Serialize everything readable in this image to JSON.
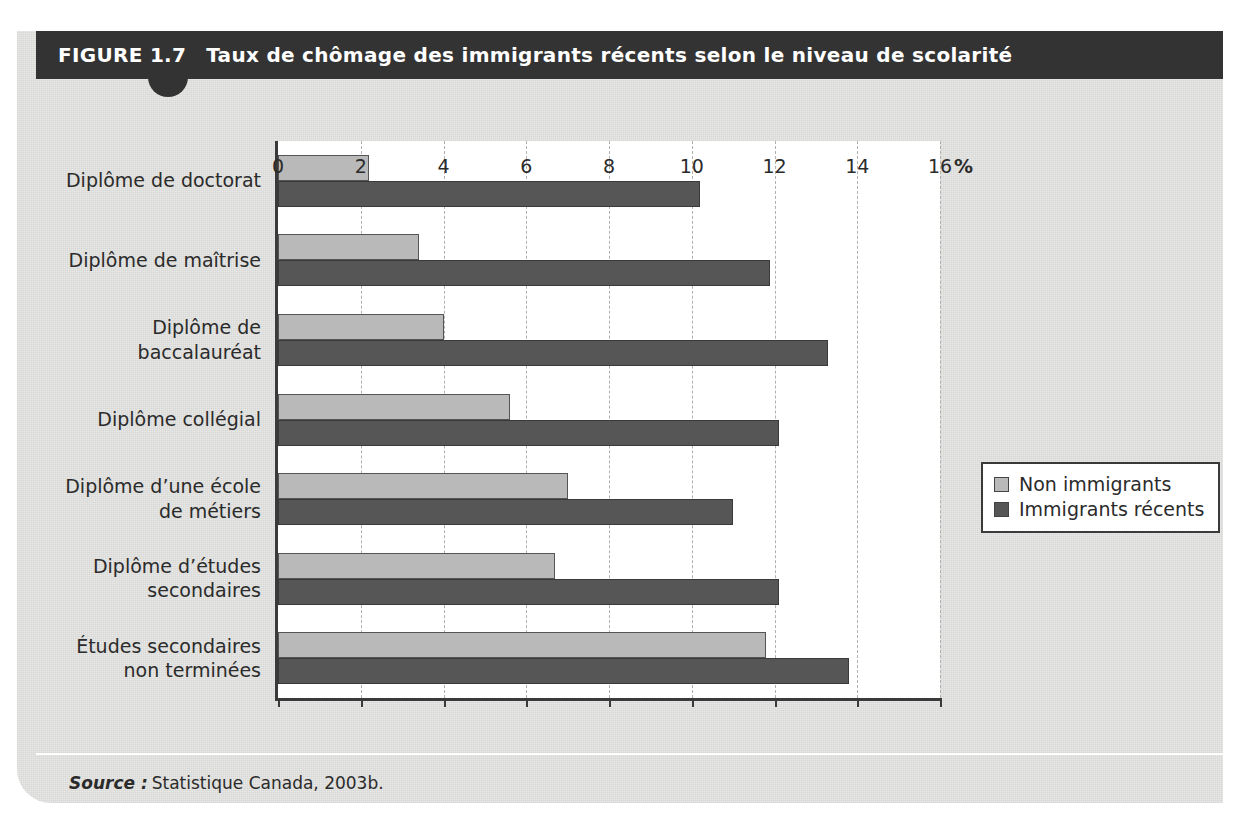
{
  "figure": {
    "number_label": "FIGURE 1.7",
    "title": "Taux de chômage des immigrants récents selon le niveau de scolarité",
    "source_label": "Source :",
    "source_text": "Statistique Canada, 2003b."
  },
  "colors": {
    "header_bar": "#333333",
    "card_background": "#e8e8e6",
    "plot_background": "#ffffff",
    "series_light": "#b9b9b9",
    "series_dark": "#565656",
    "axis": "#3a3a3a",
    "gridline": "#b0b0b0"
  },
  "chart_data": {
    "type": "bar",
    "orientation": "horizontal",
    "title": "Taux de chômage des immigrants récents selon le niveau de scolarité",
    "xlabel": "%",
    "ylabel": "",
    "xlim": [
      0,
      16
    ],
    "xticks": [
      0,
      2,
      4,
      6,
      8,
      10,
      12,
      14,
      16
    ],
    "xtick_labels": [
      "0",
      "2",
      "4",
      "6",
      "8",
      "10",
      "12",
      "14",
      "16"
    ],
    "grid": "vertical-dashed",
    "legend_position": "right",
    "categories": [
      "Diplôme de doctorat",
      "Diplôme de\nbaccalauréat",
      "Diplôme de maîtrise",
      "Diplôme collégial",
      "Diplôme d’une école\nde métiers",
      "Diplôme d’études\nsecondaires",
      "Études secondaires\nnon terminées"
    ],
    "category_rows": [
      {
        "lines": [
          "Diplôme de doctorat"
        ],
        "light": 2.2,
        "dark": 10.2
      },
      {
        "lines": [
          "Diplôme de maîtrise"
        ],
        "light": 3.4,
        "dark": 11.9
      },
      {
        "lines": [
          "Diplôme de",
          "baccalauréat"
        ],
        "light": 4.0,
        "dark": 13.3
      },
      {
        "lines": [
          "Diplôme collégial"
        ],
        "light": 5.6,
        "dark": 12.1
      },
      {
        "lines": [
          "Diplôme d’une école",
          "de métiers"
        ],
        "light": 7.0,
        "dark": 11.0
      },
      {
        "lines": [
          "Diplôme d’études",
          "secondaires"
        ],
        "light": 6.7,
        "dark": 12.1
      },
      {
        "lines": [
          "Études secondaires",
          "non terminées"
        ],
        "light": 11.8,
        "dark": 13.8
      }
    ],
    "series": [
      {
        "name": "Non immigrants",
        "key": "light",
        "color": "#b9b9b9",
        "values": [
          2.2,
          3.4,
          4.0,
          5.6,
          7.0,
          6.7,
          11.8
        ]
      },
      {
        "name": "Immigrants récents",
        "key": "dark",
        "color": "#565656",
        "values": [
          10.2,
          11.9,
          13.3,
          12.1,
          11.0,
          12.1,
          13.8
        ]
      }
    ]
  },
  "legend": {
    "items": [
      {
        "label": "Non immigrants",
        "swatch": "light"
      },
      {
        "label": "Immigrants récents",
        "swatch": "dark"
      }
    ]
  }
}
